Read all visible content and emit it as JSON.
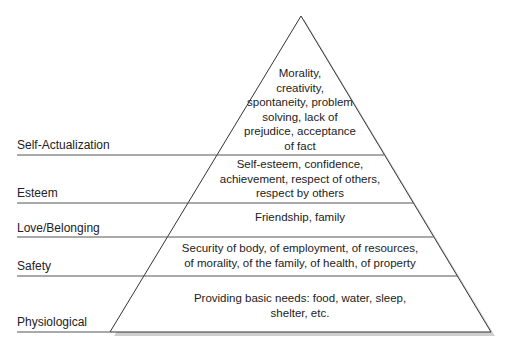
{
  "diagram": {
    "type": "pyramid",
    "levels": [
      {
        "name": "Self-Actualization",
        "description": "Morality, creativity, spontaneity, problem solving, lack of prejudice, acceptance of fact",
        "lines": [
          "Morality,",
          "creativity,",
          "spontaneity, problem",
          "solving, lack of",
          "prejudice, acceptance",
          "of fact"
        ]
      },
      {
        "name": "Esteem",
        "description": "Self-esteem, confidence, achievement, respect of others, respect by others",
        "lines": [
          "Self-esteem, confidence,",
          "achievement, respect of others,",
          "respect by others"
        ]
      },
      {
        "name": "Love/Belonging",
        "description": "Friendship, family",
        "lines": [
          "Friendship, family"
        ]
      },
      {
        "name": "Safety",
        "description": "Security of body, of employment, of resources, of morality, of the family, of health, of property",
        "lines": [
          "Security of body, of employment, of resources,",
          "of morality, of the family, of health, of property"
        ]
      },
      {
        "name": "Physiological",
        "description": "Providing basic needs: food, water, sleep, shelter, etc.",
        "lines": [
          "Providing basic needs: food, water, sleep,",
          "shelter, etc."
        ]
      }
    ]
  }
}
